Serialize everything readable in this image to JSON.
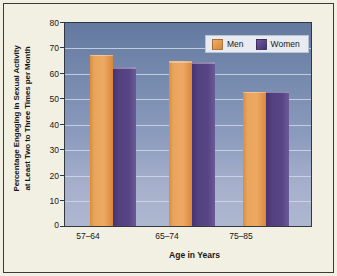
{
  "chart_data": {
    "type": "bar",
    "title": "",
    "xlabel": "Age in Years",
    "ylabel_line1": "Percentage Engaging in Sexual Activity",
    "ylabel_line2": "at Least Two to Three Times per Month",
    "categories": [
      "57–64",
      "65–74",
      "75–85"
    ],
    "series": [
      {
        "name": "Men",
        "values": [
          67.5,
          65,
          53
        ],
        "color": "#e39a52"
      },
      {
        "name": "Women",
        "values": [
          62.5,
          64.5,
          53
        ],
        "color": "#53407f"
      }
    ],
    "ylim": [
      0,
      80
    ],
    "yticks": [
      0,
      10,
      20,
      30,
      40,
      50,
      60,
      70,
      80
    ],
    "ytick_labels": [
      "0",
      "10",
      "20",
      "30",
      "40",
      "50",
      "60",
      "70",
      "80"
    ],
    "grid": true,
    "grid_axis": "y",
    "legend_position": "top-right-inside",
    "plot_background": "vertical gradient slate blue to light periwinkle",
    "figure_background": "#f2efe3"
  },
  "legend": {
    "items": [
      {
        "label": "Men",
        "swatch": "men-color-swatch"
      },
      {
        "label": "Women",
        "swatch": "women-color-swatch"
      }
    ]
  }
}
